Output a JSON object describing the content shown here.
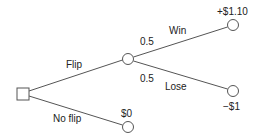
{
  "diagram": {
    "type": "decision-tree",
    "nodes": {
      "decision": {
        "shape": "square"
      },
      "chance": {
        "shape": "circle"
      },
      "win_outcome": {
        "shape": "circle",
        "label": "+$1.10"
      },
      "lose_outcome": {
        "shape": "circle",
        "label": "−$1"
      },
      "no_flip_outcome": {
        "shape": "circle",
        "label": "$0"
      }
    },
    "edges": {
      "flip": {
        "label": "Flip"
      },
      "no_flip": {
        "label": "No flip"
      },
      "win": {
        "label": "Win",
        "probability": "0.5"
      },
      "lose": {
        "label": "Lose",
        "probability": "0.5"
      }
    },
    "colors": {
      "stroke": "#555555",
      "text": "#222222",
      "fill": "#ffffff"
    }
  }
}
